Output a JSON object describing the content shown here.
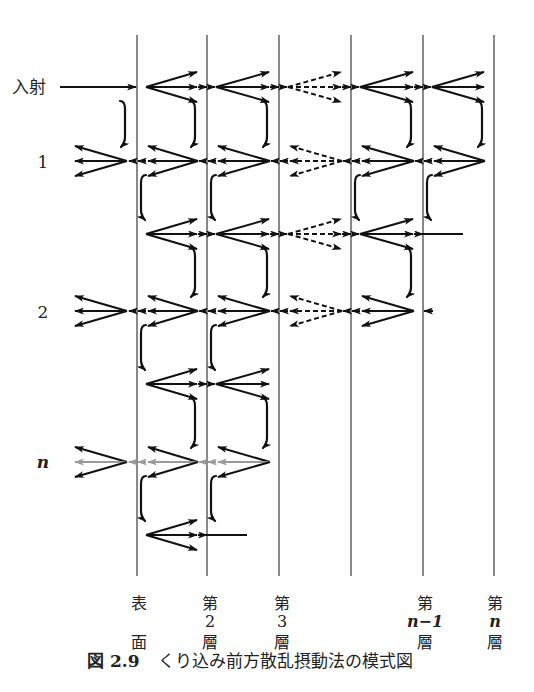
{
  "figure": {
    "caption": {
      "label": "図 2.9",
      "title": "くり込み前方散乱摂動法の模式図"
    },
    "row_labels": {
      "incident": "入射",
      "order_1": "1",
      "order_2": "2",
      "order_n": "n"
    },
    "plane_count": 6,
    "plane_labels": [
      {
        "top": "表",
        "middle": "",
        "bottom": "面"
      },
      {
        "top": "第",
        "middle": "2",
        "bottom": "層"
      },
      {
        "top": "第",
        "middle": "3",
        "bottom": "層"
      },
      {
        "top": "",
        "middle": "",
        "bottom": ""
      },
      {
        "top": "第",
        "middle": "n−1",
        "bottom": "層"
      },
      {
        "top": "第",
        "middle": "n",
        "bottom": "層"
      }
    ],
    "dashed_gaps": [
      2
    ],
    "rows": [
      {
        "id": "incident",
        "label": "入射",
        "direction": "forward",
        "incident_beam": true,
        "gaps": [
          0,
          1,
          2,
          3,
          4
        ]
      },
      {
        "id": "order-1-backward",
        "label": "1",
        "direction": "backward",
        "outside_fan": true,
        "gaps": [
          0,
          1,
          2,
          3,
          4
        ]
      },
      {
        "id": "order-1-forward",
        "label": "",
        "direction": "forward",
        "gaps": [
          0,
          1,
          2,
          3
        ],
        "transmitted_gap": 4
      },
      {
        "id": "order-2-backward",
        "label": "2",
        "direction": "backward",
        "outside_fan": true,
        "gaps": [
          0,
          1,
          2,
          3
        ],
        "stub_plane": 4
      },
      {
        "id": "order-2-forward",
        "label": "",
        "direction": "forward",
        "gaps": [
          0,
          1
        ]
      },
      {
        "id": "order-n-backward",
        "label": "n",
        "direction": "backward",
        "outside_fan": true,
        "gaps": [
          0,
          1
        ],
        "faint_center": true
      },
      {
        "id": "order-n-forward",
        "label": "",
        "direction": "forward",
        "gaps": [
          0
        ],
        "transmitted_gap": 1
      }
    ],
    "reflections": [
      {
        "from": 0,
        "to": 1,
        "side": "before-plane",
        "planes": [
          0,
          1,
          2,
          4,
          5
        ]
      },
      {
        "from": 1,
        "to": 2,
        "side": "after-plane",
        "planes": [
          0,
          1,
          3,
          4
        ]
      },
      {
        "from": 2,
        "to": 3,
        "side": "before-plane",
        "planes": [
          1,
          2,
          4
        ]
      },
      {
        "from": 3,
        "to": 4,
        "side": "after-plane",
        "planes": [
          0,
          1
        ]
      },
      {
        "from": 4,
        "to": 5,
        "side": "before-plane",
        "planes": [
          1,
          2
        ]
      },
      {
        "from": 5,
        "to": 6,
        "side": "after-plane",
        "planes": [
          0,
          1
        ]
      }
    ]
  }
}
